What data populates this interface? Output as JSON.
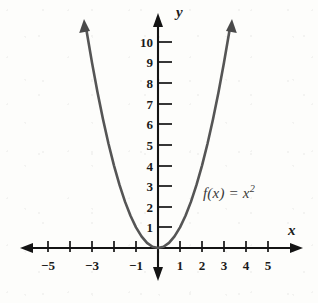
{
  "figure": {
    "function_label": "f(x) = x",
    "function_exponent": "2",
    "x_axis_name": "x",
    "y_axis_name": "y",
    "colors": {
      "background": "#fdfdfb",
      "axis": "#141414",
      "curve": "#555555",
      "text": "#1a1a1a",
      "curve_label": "#3a3a3a"
    }
  },
  "chart_data": {
    "type": "line",
    "xlabel": "x",
    "ylabel": "y",
    "xlim": [
      -6.2,
      6.5
    ],
    "ylim": [
      -1.5,
      11.5
    ],
    "grid": false,
    "legend": false,
    "annotations": [
      {
        "text": "f(x) = x²",
        "x": 2.05,
        "y": 2.6
      }
    ],
    "x_ticks": [
      -5,
      -4,
      -3,
      -2,
      -1,
      1,
      2,
      3,
      4,
      5
    ],
    "x_tick_labels": [
      "−5",
      "",
      "−3",
      "",
      "−1",
      "1",
      "2",
      "3",
      "4",
      "5"
    ],
    "y_ticks": [
      1,
      2,
      3,
      4,
      5,
      6,
      7,
      8,
      9,
      10
    ],
    "y_tick_labels": [
      "1",
      "2",
      "3",
      "4",
      "5",
      "6",
      "7",
      "8",
      "9",
      "10"
    ],
    "series": [
      {
        "name": "f(x) = x²",
        "x": [
          -3.25,
          -3.0,
          -2.75,
          -2.5,
          -2.25,
          -2.0,
          -1.75,
          -1.5,
          -1.25,
          -1.0,
          -0.75,
          -0.5,
          -0.25,
          0,
          0.25,
          0.5,
          0.75,
          1.0,
          1.25,
          1.5,
          1.75,
          2.0,
          2.25,
          2.5,
          2.75,
          3.0,
          3.25
        ],
        "y": [
          10.5625,
          9.0,
          7.5625,
          6.25,
          5.0625,
          4.0,
          3.0625,
          2.25,
          1.5625,
          1.0,
          0.5625,
          0.25,
          0.0625,
          0,
          0.0625,
          0.25,
          0.5625,
          1.0,
          1.5625,
          2.25,
          3.0625,
          4.0,
          5.0625,
          6.25,
          7.5625,
          9.0,
          10.5625
        ]
      }
    ]
  },
  "x_tick_items": [
    {
      "label": "−5",
      "value": -5,
      "px": 48
    },
    {
      "label": "",
      "value": -4,
      "px": 70
    },
    {
      "label": "−3",
      "value": -3,
      "px": 92
    },
    {
      "label": "",
      "value": -2,
      "px": 114
    },
    {
      "label": "−1",
      "value": -1,
      "px": 136
    },
    {
      "label": "1",
      "value": 1,
      "px": 180
    },
    {
      "label": "2",
      "value": 2,
      "px": 202
    },
    {
      "label": "3",
      "value": 3,
      "px": 224
    },
    {
      "label": "4",
      "value": 4,
      "px": 246
    },
    {
      "label": "5",
      "value": 5,
      "px": 268
    }
  ],
  "y_tick_items": [
    {
      "label": "1",
      "value": 1,
      "px": 227
    },
    {
      "label": "2",
      "value": 2,
      "px": 207
    },
    {
      "label": "3",
      "value": 3,
      "px": 186
    },
    {
      "label": "4",
      "value": 4,
      "px": 166
    },
    {
      "label": "5",
      "value": 5,
      "px": 145
    },
    {
      "label": "6",
      "value": 6,
      "px": 124
    },
    {
      "label": "7",
      "value": 7,
      "px": 104
    },
    {
      "label": "8",
      "value": 8,
      "px": 83
    },
    {
      "label": "9",
      "value": 9,
      "px": 62
    },
    {
      "label": "10",
      "value": 10,
      "px": 42
    }
  ]
}
